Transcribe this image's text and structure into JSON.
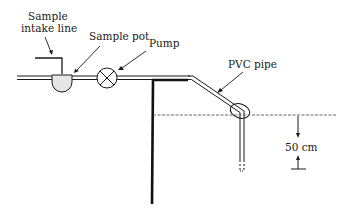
{
  "diagram": {
    "type": "schematic",
    "labels": {
      "intake_line_1": "Sample",
      "intake_line_2": "intake line",
      "sample_pot": "Sample pot",
      "pump": "Pump",
      "pvc_pipe": "PVC pipe",
      "depth": "50 cm"
    },
    "components": [
      {
        "id": "sample-intake-line",
        "label": "Sample intake line"
      },
      {
        "id": "sample-pot",
        "label": "Sample pot"
      },
      {
        "id": "pump",
        "label": "Pump"
      },
      {
        "id": "pvc-pipe",
        "label": "PVC pipe"
      },
      {
        "id": "water-surface",
        "label": ""
      },
      {
        "id": "depth-marker",
        "label": "50 cm"
      }
    ],
    "colors": {
      "line": "#1a1a1a",
      "pot_fill": "#e6e6e6",
      "water_line": "#555555"
    }
  }
}
